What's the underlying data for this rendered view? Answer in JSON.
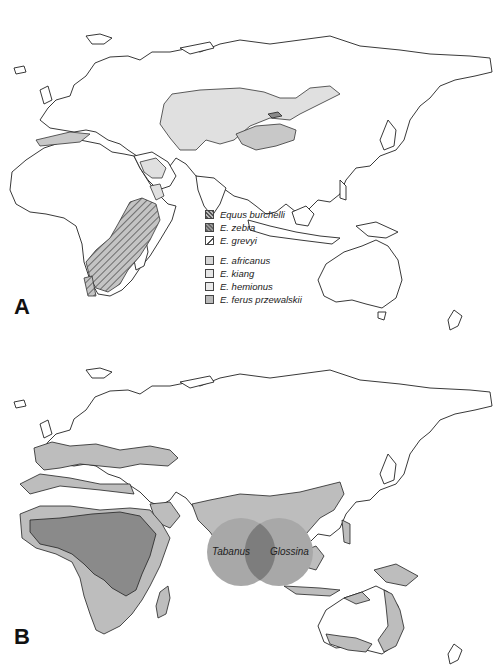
{
  "figure": {
    "panels": [
      {
        "label": "A",
        "legend": {
          "groups": [
            {
              "items": [
                {
                  "name": "Equus burchelli",
                  "swatch": "#6e6e6e",
                  "pattern": "hatched"
                },
                {
                  "name": "E. zebra",
                  "swatch": "#7a7a7a",
                  "pattern": "hatched"
                },
                {
                  "name": "E. grevyi",
                  "swatch": "#ffffff",
                  "pattern": "hatched-light"
                }
              ]
            },
            {
              "items": [
                {
                  "name": "E. africanus",
                  "swatch": "#d6d6d6"
                },
                {
                  "name": "E. kiang",
                  "swatch": "#e6e6e6"
                },
                {
                  "name": "E. hemionus",
                  "swatch": "#e9e9e9"
                },
                {
                  "name": "E. ferus przewalskii",
                  "swatch": "#b9b9b9"
                }
              ]
            }
          ]
        }
      },
      {
        "label": "B",
        "venn": {
          "left": {
            "label": "Tabanus",
            "color": "#a8a8a8"
          },
          "right": {
            "label": "Glossina",
            "color": "#a8a8a8"
          },
          "overlap_color": "#7d7d7d"
        }
      }
    ],
    "colors": {
      "coast_stroke": "#222222",
      "land": "#ffffff",
      "range_light": "#e0e0e0",
      "range_mid": "#c8c8c8",
      "tabanus_only": "#bdbdbd",
      "overlap": "#8a8a8a"
    }
  }
}
